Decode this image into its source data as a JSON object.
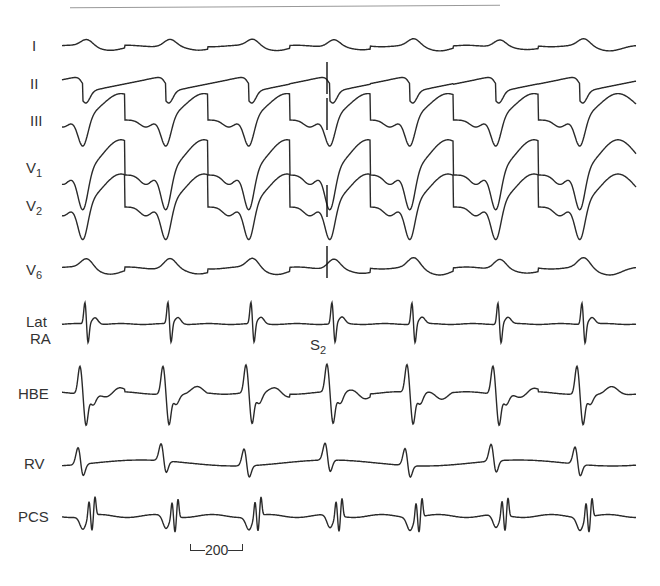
{
  "chart_data": {
    "type": "line",
    "title": "",
    "channels": [
      {
        "name": "I",
        "y": 46,
        "amp": 7,
        "shape": "smooth"
      },
      {
        "name": "II",
        "y": 84,
        "amp": 14,
        "shape": "sawtooth"
      },
      {
        "name": "III",
        "y": 120,
        "amp": 24,
        "shape": "deep"
      },
      {
        "name": "V1",
        "y": 175,
        "amp": 32,
        "shape": "deep"
      },
      {
        "name": "V2",
        "y": 207,
        "amp": 30,
        "shape": "deep"
      },
      {
        "name": "V6",
        "y": 268,
        "amp": 10,
        "shape": "smooth"
      },
      {
        "name": "Lat RA",
        "y": 324,
        "amp": 22,
        "shape": "spike"
      },
      {
        "name": "HBE",
        "y": 393,
        "amp": 28,
        "shape": "hbe"
      },
      {
        "name": "RV",
        "y": 463,
        "amp": 24,
        "shape": "rv"
      },
      {
        "name": "PCS",
        "y": 516,
        "amp": 26,
        "shape": "pcs"
      }
    ],
    "beat_x": [
      83,
      166,
      249,
      330,
      410,
      496,
      580
    ],
    "stimulus_x": 327,
    "annotations": [
      "S2"
    ],
    "scale_bar": {
      "label": "200",
      "units": "ms",
      "x1": 194,
      "x2": 250,
      "y": 550
    },
    "xrange": [
      62,
      636
    ]
  },
  "labels": {
    "I": "I",
    "II": "II",
    "III": "III",
    "V1_main": "V",
    "V1_sub": "1",
    "V2_main": "V",
    "V2_sub": "2",
    "V6_main": "V",
    "V6_sub": "6",
    "LatRA_line1": "Lat",
    "LatRA_line2": "RA",
    "HBE": "HBE",
    "RV": "RV",
    "PCS": "PCS",
    "S2_main": "S",
    "S2_sub": "2",
    "scale": "200"
  }
}
